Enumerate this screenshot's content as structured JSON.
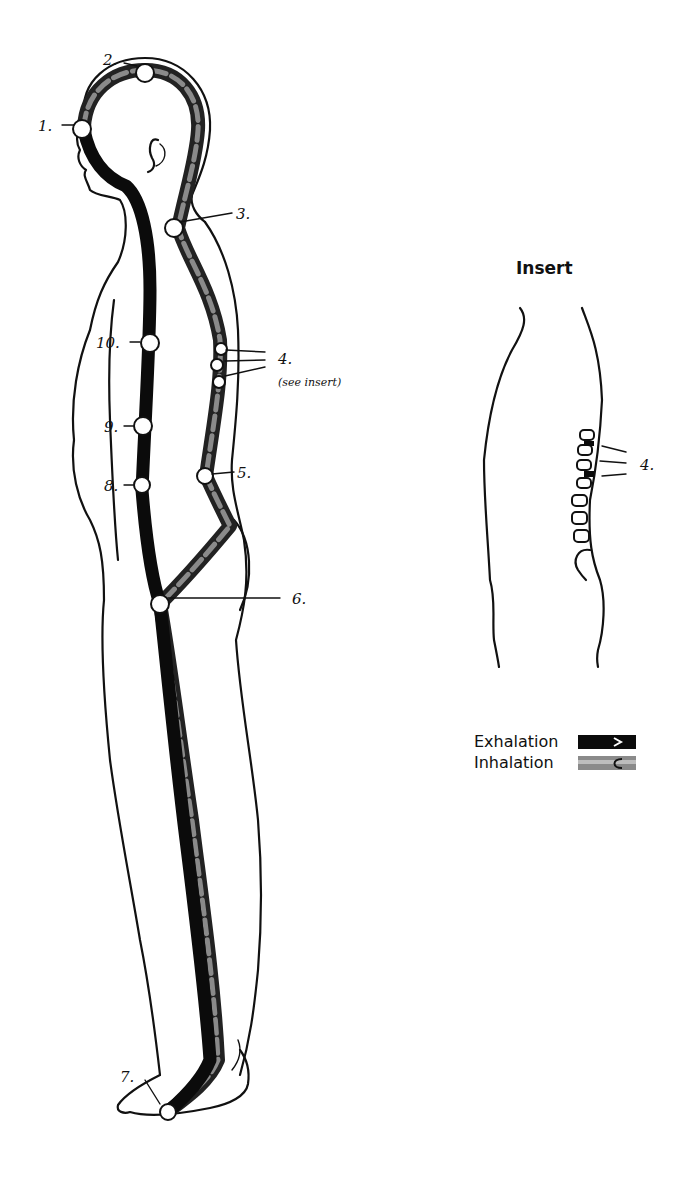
{
  "figure": {
    "type": "anatomical breathing-pathway diagram",
    "main_points": [
      {
        "id": 1,
        "label": "1."
      },
      {
        "id": 2,
        "label": "2."
      },
      {
        "id": 3,
        "label": "3."
      },
      {
        "id": 4,
        "label": "4.",
        "note": "(see insert)"
      },
      {
        "id": 5,
        "label": "5."
      },
      {
        "id": 6,
        "label": "6."
      },
      {
        "id": 7,
        "label": "7."
      },
      {
        "id": 8,
        "label": "8."
      },
      {
        "id": 9,
        "label": "9."
      },
      {
        "id": 10,
        "label": "10."
      }
    ]
  },
  "insert": {
    "title": "Insert",
    "point_label": "4."
  },
  "legend": {
    "items": [
      {
        "label": "Exhalation",
        "swatch": "solid-black-arrow",
        "color": "#0b0b0b"
      },
      {
        "label": "Inhalation",
        "swatch": "mottled-gray-arrow",
        "color": "#8a8a8a"
      }
    ]
  }
}
